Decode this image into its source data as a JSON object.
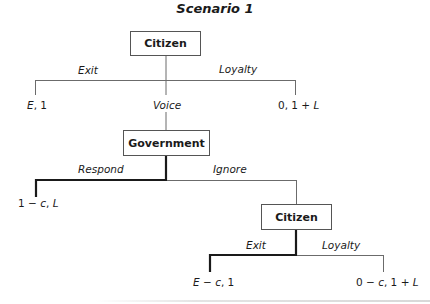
{
  "title": "Scenario 1",
  "tree": {
    "root": {
      "player": "Citizen",
      "branches": {
        "left": "Exit",
        "middle": "Voice",
        "right": "Loyalty"
      },
      "payoffs": {
        "exit": {
          "a": "E",
          "b": ", 1"
        },
        "loyalty": {
          "a": "0, 1 + ",
          "b": "L"
        }
      }
    },
    "government": {
      "player": "Government",
      "branches": {
        "left": "Respond",
        "right": "Ignore"
      },
      "payoffs": {
        "respond": {
          "a": "1 − ",
          "b": "c",
          "c": ", ",
          "d": "L"
        }
      },
      "equilibrium_branch": "Respond"
    },
    "citizen2": {
      "player": "Citizen",
      "branches": {
        "left": "Exit",
        "right": "Loyalty"
      },
      "payoffs": {
        "exit": {
          "a": "E",
          "b": " − ",
          "c": "c",
          "d": ", 1"
        },
        "loyalty": {
          "a": "0 − ",
          "b": "c",
          "c": ", 1 + ",
          "d": "L"
        }
      },
      "equilibrium_branch": "Exit"
    }
  },
  "colors": {
    "thin_line": "#6b6b6b",
    "thick_line": "#1a1a1a",
    "box_border": "#555555"
  }
}
